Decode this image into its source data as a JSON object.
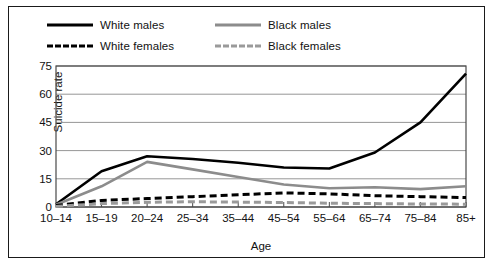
{
  "chart_data": {
    "type": "line",
    "title": "",
    "xlabel": "Age",
    "ylabel": "Suicide rate",
    "categories": [
      "10–14",
      "15–19",
      "20–24",
      "25–34",
      "35–44",
      "45–54",
      "55–64",
      "65–74",
      "75–84",
      "85+"
    ],
    "ylim": [
      0,
      75
    ],
    "yticks": [
      0,
      15,
      30,
      45,
      60,
      75
    ],
    "grid": true,
    "legend_position": "above-plot",
    "series": [
      {
        "name": "White males",
        "color": "#000000",
        "style": "solid",
        "values": [
          1.5,
          19,
          27,
          25.5,
          23.5,
          21,
          20.5,
          29,
          45,
          71
        ]
      },
      {
        "name": "Black males",
        "color": "#8c8c8c",
        "style": "solid",
        "values": [
          1.2,
          11,
          24,
          20,
          16,
          12,
          10,
          10.5,
          9.5,
          11
        ]
      },
      {
        "name": "White females",
        "color": "#000000",
        "style": "dashed",
        "values": [
          0.8,
          3.5,
          4.5,
          5.5,
          6.5,
          7.5,
          7,
          6,
          5.5,
          5
        ]
      },
      {
        "name": "Black females",
        "color": "#9a9a9a",
        "style": "dashed",
        "values": [
          0.3,
          1.8,
          2.5,
          2.8,
          2.6,
          2.4,
          2,
          1.8,
          1.6,
          1.5
        ]
      }
    ]
  }
}
